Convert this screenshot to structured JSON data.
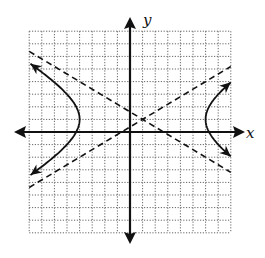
{
  "chart_data": {
    "type": "line",
    "title": "",
    "xlabel": "x",
    "ylabel": "y",
    "xlim": [
      -8,
      8
    ],
    "ylim": [
      -8,
      8
    ],
    "grid": true,
    "grid_style": "dotted",
    "grid_step": 1,
    "legend": null,
    "equation": "(x-1)^2/25 - (y-1)^2/9 = 1",
    "center": [
      1,
      1
    ],
    "a": 5,
    "b": 3,
    "vertices": [
      [
        -4,
        1
      ],
      [
        6,
        1
      ]
    ],
    "series": [
      {
        "name": "hyperbola-left-branch",
        "style": "solid",
        "arrows": "both",
        "points": [
          [
            -7.9,
            5.4
          ],
          [
            -6,
            3.94
          ],
          [
            -5,
            3.28
          ],
          [
            -4.5,
            2.84
          ],
          [
            -4.1,
            2.0
          ],
          [
            -4,
            1
          ],
          [
            -4.1,
            0.0
          ],
          [
            -4.5,
            -0.84
          ],
          [
            -5,
            -1.28
          ],
          [
            -6,
            -1.94
          ],
          [
            -7.9,
            -3.4
          ]
        ]
      },
      {
        "name": "hyperbola-right-branch",
        "style": "solid",
        "arrows": "both",
        "points": [
          [
            8,
            3.94
          ],
          [
            7,
            2.98
          ],
          [
            6.5,
            2.55
          ],
          [
            6.1,
            1.6
          ],
          [
            6,
            1
          ],
          [
            6.1,
            0.4
          ],
          [
            6.5,
            -0.55
          ],
          [
            7,
            -0.98
          ],
          [
            8,
            -1.94
          ]
        ]
      },
      {
        "name": "asymptote-negative-slope",
        "style": "dashed",
        "equation": "y - 1 = -(3/5)(x - 1)",
        "points": [
          [
            -8,
            6.4
          ],
          [
            8,
            -3.2
          ]
        ]
      },
      {
        "name": "asymptote-positive-slope",
        "style": "dashed",
        "equation": "y - 1 = (3/5)(x - 1)",
        "points": [
          [
            -8,
            -4.4
          ],
          [
            8,
            5.2
          ]
        ]
      }
    ]
  },
  "labels": {
    "x_axis": "x",
    "y_axis": "y"
  }
}
